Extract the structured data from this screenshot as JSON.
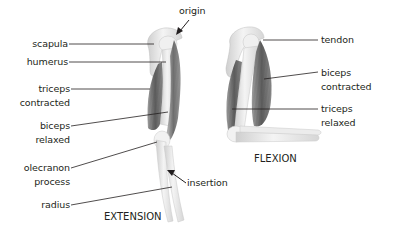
{
  "diagram": {
    "panels": [
      {
        "id": "extension",
        "caption": "EXTENSION"
      },
      {
        "id": "flexion",
        "caption": "FLEXION"
      }
    ],
    "labels": {
      "origin": "origin",
      "scapula": "scapula",
      "humerus": "humerus",
      "triceps_contracted": [
        "triceps",
        "contracted"
      ],
      "biceps_relaxed": [
        "biceps",
        "relaxed"
      ],
      "olecranon_process": [
        "olecranon",
        "process"
      ],
      "radius": "radius",
      "insertion": "insertion",
      "tendon": "tendon",
      "biceps_contracted": [
        "biceps",
        "contracted"
      ],
      "triceps_relaxed": [
        "triceps",
        "relaxed"
      ]
    },
    "colors": {
      "text": "#231f20",
      "leader_line": "#231f20",
      "bone": "#e8e8e8",
      "muscle": "#8a8a8a",
      "background": "#ffffff"
    }
  }
}
